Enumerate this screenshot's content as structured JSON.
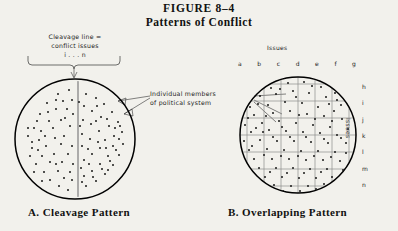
{
  "figure": {
    "title_main": "FIGURE 8–4",
    "title_sub": "Patterns of Conflict"
  },
  "annotations": {
    "cleavage_note": "Cleavage line =\nconflict issues\ni . . . n",
    "cleavage_note_line1": "Cleavage line =",
    "cleavage_note_line2": "conflict issues",
    "cleavage_note_line3": "i . . . n",
    "members_note_line1": "Individual members",
    "members_note_line2": "of political system"
  },
  "panel_a": {
    "caption": "A. Cleavage Pattern",
    "description": "Circle of individual members split by a single vertical cleavage line"
  },
  "panel_b": {
    "caption": "B. Overlapping Pattern",
    "description": "Circle of individual members crossed by a grid of overlapping issue lines",
    "issues_label_top": "Issues",
    "issues_label_right": "Issues",
    "column_letters": [
      "a",
      "b",
      "c",
      "d",
      "e",
      "f",
      "g"
    ],
    "row_letters": [
      "h",
      "i",
      "j",
      "k",
      "l",
      "m",
      "n"
    ]
  },
  "colors": {
    "page_background": "#f2f1ec",
    "ink": "#111111",
    "grid_line": "#8d8d8d",
    "cleavage_line": "#9a9a9a",
    "dot": "#1a1a1a"
  }
}
